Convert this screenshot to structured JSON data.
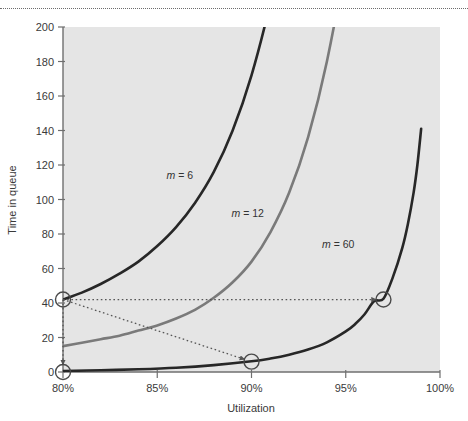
{
  "figure": {
    "name": "time-in-queue-vs-utilization",
    "background_color": "#ffffff",
    "plot_background_color": "#e5e5e5",
    "top_rule_style": "dotted",
    "top_rule_color": "#6d6d6d"
  },
  "chart_data": {
    "type": "line",
    "title": "",
    "subtitle": "",
    "xlabel": "Utilization",
    "ylabel": "Time in queue",
    "xlim": [
      80,
      100
    ],
    "ylim": [
      0,
      200
    ],
    "xticks": [
      80,
      85,
      90,
      95,
      100
    ],
    "xtick_labels": [
      "80%",
      "85%",
      "90%",
      "95%",
      "100%"
    ],
    "yticks": [
      0,
      20,
      40,
      60,
      80,
      100,
      120,
      140,
      160,
      180,
      200
    ],
    "ytick_labels": [
      "0",
      "20",
      "40",
      "60",
      "80",
      "100",
      "120",
      "140",
      "160",
      "180",
      "200"
    ],
    "grid": false,
    "legend_position": "inline-annotations",
    "series": [
      {
        "name": "m = 6",
        "label": "m = 6",
        "label_m": "m",
        "label_eq": "= 6",
        "color": "#272727",
        "width": 2.6,
        "label_x": 86.2,
        "label_y": 112,
        "x": [
          80,
          81,
          82,
          83,
          84,
          85,
          86,
          87,
          88,
          89,
          90,
          91,
          92,
          93,
          94,
          95
        ],
        "y": [
          42,
          46,
          51,
          57,
          64,
          73,
          84,
          98,
          116,
          140,
          172,
          214,
          265,
          330,
          410,
          505
        ]
      },
      {
        "name": "m = 12",
        "label": "m = 12",
        "label_m": "m",
        "label_eq": "= 12",
        "color": "#7a7a7a",
        "width": 2.6,
        "label_x": 89.8,
        "label_y": 90,
        "x": [
          80,
          81,
          82,
          83,
          84,
          85,
          86,
          87,
          88,
          89,
          90,
          91,
          92,
          93,
          94,
          95,
          96,
          97
        ],
        "y": [
          15,
          17,
          19,
          21,
          24,
          27,
          31,
          36,
          43,
          52,
          64,
          81,
          104,
          136,
          180,
          240,
          320,
          430
        ]
      },
      {
        "name": "m = 60",
        "label": "m = 60",
        "label_m": "m",
        "label_eq": "= 60",
        "color": "#272727",
        "width": 2.6,
        "label_x": 94.6,
        "label_y": 72,
        "x": [
          80,
          82,
          84,
          86,
          88,
          90,
          91,
          92,
          93,
          94,
          95,
          95.5,
          96,
          96.5,
          97,
          97.5,
          98,
          98.3,
          98.6,
          98.8,
          99
        ],
        "y": [
          0.6,
          1.0,
          1.6,
          2.5,
          4.0,
          6.2,
          7.8,
          10.0,
          13.0,
          17.2,
          23.5,
          27.8,
          33.5,
          41.0,
          42.5,
          55,
          72,
          86,
          104,
          120,
          141
        ]
      }
    ],
    "annotations": [
      {
        "name": "marker-80-42",
        "kind": "circle-marker",
        "x": 80,
        "y": 42,
        "color": "#4a4a4a"
      },
      {
        "name": "marker-80-0",
        "kind": "circle-marker",
        "x": 80,
        "y": 0,
        "color": "#4a4a4a"
      },
      {
        "name": "marker-90-6",
        "kind": "circle-marker",
        "x": 90,
        "y": 6,
        "color": "#4a4a4a"
      },
      {
        "name": "marker-97-42",
        "kind": "circle-marker",
        "x": 97,
        "y": 42,
        "color": "#4a4a4a"
      },
      {
        "name": "arrow-horizontal-80-42-to-97-42",
        "kind": "dotted-arrow",
        "from": [
          80,
          42
        ],
        "to": [
          97,
          42
        ],
        "color": "#555555"
      },
      {
        "name": "arrow-diagonal-80-42-to-90-6",
        "kind": "dotted-arrow",
        "from": [
          80,
          42
        ],
        "to": [
          90,
          6
        ],
        "color": "#555555"
      },
      {
        "name": "arrow-vertical-80-42-to-80-0",
        "kind": "dotted-arrow",
        "from": [
          80,
          42
        ],
        "to": [
          80,
          0
        ],
        "color": "#555555"
      }
    ]
  },
  "geometry": {
    "plot_left": 63,
    "plot_right": 440,
    "plot_top": 27,
    "plot_bottom": 372,
    "axis_color": "#6f6f6f",
    "tick_color": "#6f6f6f"
  }
}
